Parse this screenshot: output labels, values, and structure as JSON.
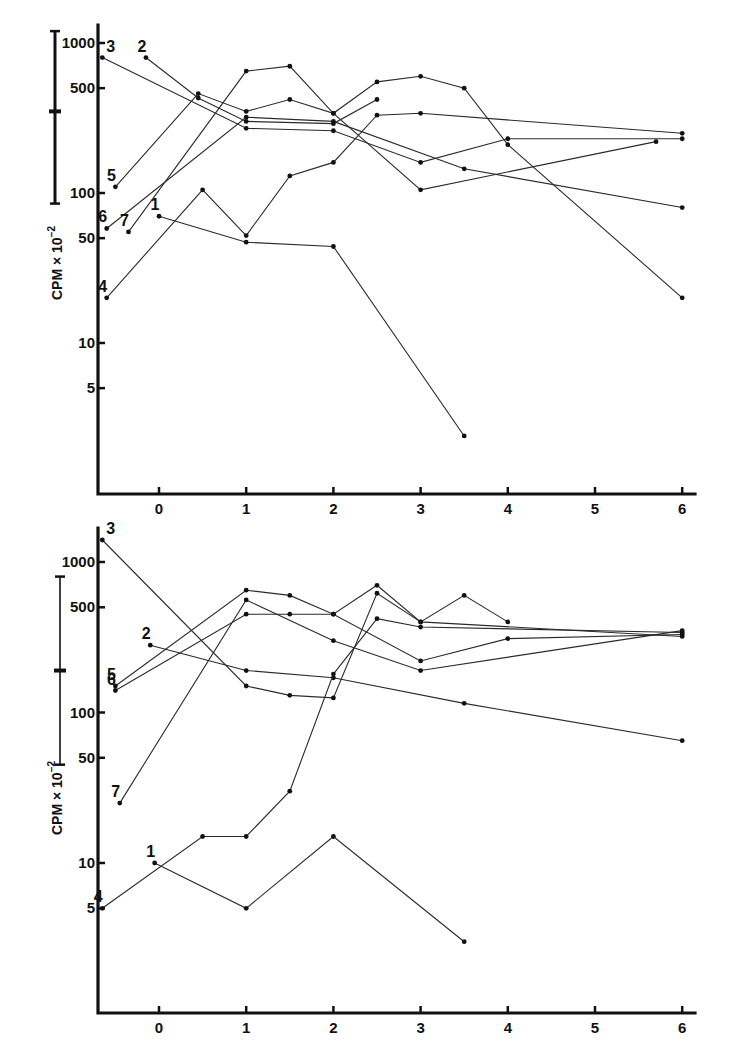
{
  "chart_data": [
    {
      "type": "line",
      "panel": "top",
      "title": "",
      "xlabel": "",
      "ylabel": "CPM × 10^-2",
      "yscale": "log",
      "ylim": [
        1.5,
        1300
      ],
      "xlim": [
        -0.7,
        6.2
      ],
      "grid": false,
      "x_ticks": [
        "0",
        "1",
        "2",
        "3",
        "4",
        "5",
        "6"
      ],
      "y_ticks": [
        "1000",
        "500",
        "100",
        "50",
        "10",
        "5"
      ],
      "scale_bar": {
        "top": 1200,
        "mid": 350,
        "bottom": 85
      },
      "series": [
        {
          "name": "1",
          "points": [
            [
              0,
              70
            ],
            [
              1,
              47
            ],
            [
              2,
              44
            ],
            [
              3.5,
              2.4
            ]
          ],
          "label_pos": [
            0,
            70
          ]
        },
        {
          "name": "2",
          "points": [
            [
              -0.15,
              800
            ],
            [
              0.45,
              430
            ],
            [
              1,
              300
            ],
            [
              2,
              290
            ],
            [
              2.5,
              420
            ]
          ],
          "label_pos": [
            -0.15,
            800
          ]
        },
        {
          "name": "3",
          "points": [
            [
              -0.65,
              800
            ],
            [
              1,
              270
            ],
            [
              2,
              260
            ],
            [
              3,
              160
            ],
            [
              4,
              230
            ],
            [
              6,
              230
            ]
          ],
          "label_pos": [
            -0.65,
            800
          ]
        },
        {
          "name": "4",
          "points": [
            [
              -0.6,
              20
            ],
            [
              0.5,
              105
            ],
            [
              1,
              52
            ],
            [
              1.5,
              130
            ],
            [
              2,
              160
            ],
            [
              2.5,
              330
            ],
            [
              3,
              340
            ],
            [
              6,
              250
            ]
          ],
          "label_pos": [
            -0.6,
            20
          ]
        },
        {
          "name": "5",
          "points": [
            [
              -0.5,
              110
            ],
            [
              0.45,
              460
            ],
            [
              1,
              350
            ],
            [
              1.5,
              420
            ],
            [
              2,
              340
            ],
            [
              2.5,
              550
            ],
            [
              3,
              600
            ],
            [
              3.5,
              500
            ],
            [
              4,
              210
            ],
            [
              6,
              20
            ]
          ],
          "label_pos": [
            -0.5,
            110
          ]
        },
        {
          "name": "6",
          "points": [
            [
              -0.6,
              58
            ],
            [
              1,
              320
            ],
            [
              2,
              300
            ],
            [
              3.5,
              145
            ],
            [
              6,
              80
            ]
          ],
          "label_pos": [
            -0.6,
            58
          ]
        },
        {
          "name": "7",
          "points": [
            [
              -0.35,
              55
            ],
            [
              1,
              650
            ],
            [
              1.5,
              700
            ],
            [
              2,
              340
            ],
            [
              3,
              105
            ],
            [
              5.7,
              220
            ]
          ],
          "label_pos": [
            -0.35,
            55
          ]
        }
      ]
    },
    {
      "type": "line",
      "panel": "bottom",
      "title": "",
      "xlabel": "",
      "ylabel": "CPM × 10^-2",
      "yscale": "log",
      "ylim": [
        1.2,
        1500
      ],
      "xlim": [
        -0.7,
        6.2
      ],
      "grid": false,
      "x_ticks": [
        "0",
        "1",
        "2",
        "3",
        "4",
        "5",
        "6"
      ],
      "y_ticks": [
        "1000",
        "500",
        "100",
        "50",
        "10",
        "5"
      ],
      "scale_bar": {
        "top": 800,
        "mid": 190,
        "bottom": 45
      },
      "series": [
        {
          "name": "1",
          "points": [
            [
              -0.05,
              10
            ],
            [
              1,
              5
            ],
            [
              2,
              15
            ],
            [
              3.5,
              3
            ]
          ],
          "label_pos": [
            -0.05,
            10
          ]
        },
        {
          "name": "2",
          "points": [
            [
              -0.1,
              280
            ],
            [
              1,
              190
            ],
            [
              2,
              170
            ],
            [
              3.5,
              115
            ],
            [
              6,
              65
            ]
          ],
          "label_pos": [
            -0.1,
            280
          ]
        },
        {
          "name": "3",
          "points": [
            [
              -0.65,
              1400
            ],
            [
              1,
              150
            ],
            [
              1.5,
              130
            ],
            [
              2,
              125
            ],
            [
              2.5,
              620
            ],
            [
              3,
              400
            ],
            [
              3.5,
              600
            ],
            [
              4,
              400
            ]
          ],
          "label_pos": [
            -0.65,
            1400
          ]
        },
        {
          "name": "4",
          "points": [
            [
              -0.65,
              5
            ],
            [
              0.5,
              15
            ],
            [
              1,
              15
            ],
            [
              1.5,
              30
            ],
            [
              2,
              180
            ],
            [
              2.5,
              420
            ],
            [
              3,
              370
            ],
            [
              6,
              340
            ]
          ],
          "label_pos": [
            -0.65,
            5
          ]
        },
        {
          "name": "5",
          "points": [
            [
              -0.5,
              150
            ],
            [
              1,
              650
            ],
            [
              1.5,
              600
            ],
            [
              2,
              450
            ],
            [
              2.5,
              700
            ],
            [
              3,
              400
            ],
            [
              6,
              320
            ]
          ],
          "label_pos": [
            -0.5,
            150
          ]
        },
        {
          "name": "6",
          "points": [
            [
              -0.5,
              140
            ],
            [
              1,
              450
            ],
            [
              1.5,
              450
            ],
            [
              2,
              450
            ],
            [
              3,
              220
            ],
            [
              4,
              310
            ],
            [
              6,
              330
            ]
          ],
          "label_pos": [
            -0.5,
            140
          ]
        },
        {
          "name": "7",
          "points": [
            [
              -0.45,
              25
            ],
            [
              1,
              560
            ],
            [
              2,
              300
            ],
            [
              3,
              190
            ],
            [
              6,
              350
            ]
          ],
          "label_pos": [
            -0.45,
            25
          ]
        }
      ]
    }
  ],
  "panels": {
    "top": {
      "ylabel_main": "CPM",
      "ylabel_mult": "× 10",
      "ylabel_exp": "−2"
    },
    "bottom": {
      "ylabel_main": "CPM",
      "ylabel_mult": "× 10",
      "ylabel_exp": "−2"
    }
  }
}
